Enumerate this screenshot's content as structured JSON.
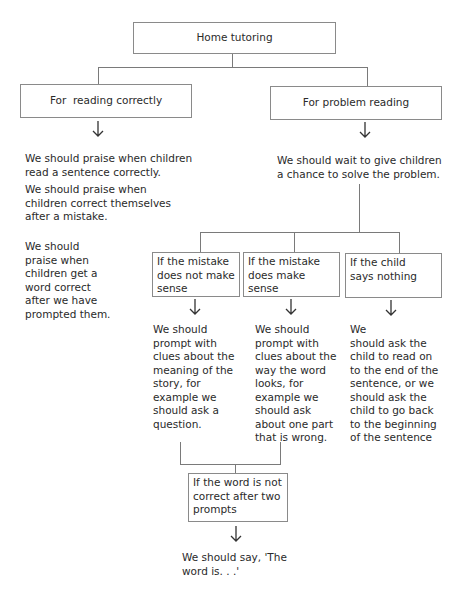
{
  "root": {
    "label": "Home tutoring"
  },
  "branches": {
    "reading_correctly": {
      "label": "For  reading correctly",
      "outcomes": [
        "We should praise when children\nread a sentence correctly.",
        "We should praise when\nchildren correct themselves\nafter a mistake.",
        "We should\npraise when\nchildren get a\nword correct\nafter we have\nprompted them."
      ]
    },
    "problem_reading": {
      "label": "For problem reading",
      "outcome": "We should wait to give children\na chance to solve the problem.",
      "cases": [
        {
          "label": "If the mistake\ndoes not make\nsense",
          "action": "We should\nprompt with\nclues about the\nmeaning of the\nstory, for\nexample we\nshould ask a\nquestion."
        },
        {
          "label": "If the mistake\ndoes make sense",
          "action": "We should\nprompt with\nclues about the\nway the word\nlooks, for\nexample we\nshould ask\nabout one part\nthat is wrong."
        },
        {
          "label": "If the child\nsays nothing",
          "action": "We\nshould ask the\nchild to read on\nto the end of the\nsentence, or we\nshould ask the\nchild to go back\nto the beginning\nof the sentence"
        }
      ],
      "fallback": {
        "label": "If the word is not\ncorrect after two\nprompts",
        "action": "We should say, 'The\nword is. . .'"
      }
    }
  },
  "colors": {
    "line": "#7a7a7a",
    "border": "#8a8a8a",
    "text": "#2a2a2a"
  }
}
